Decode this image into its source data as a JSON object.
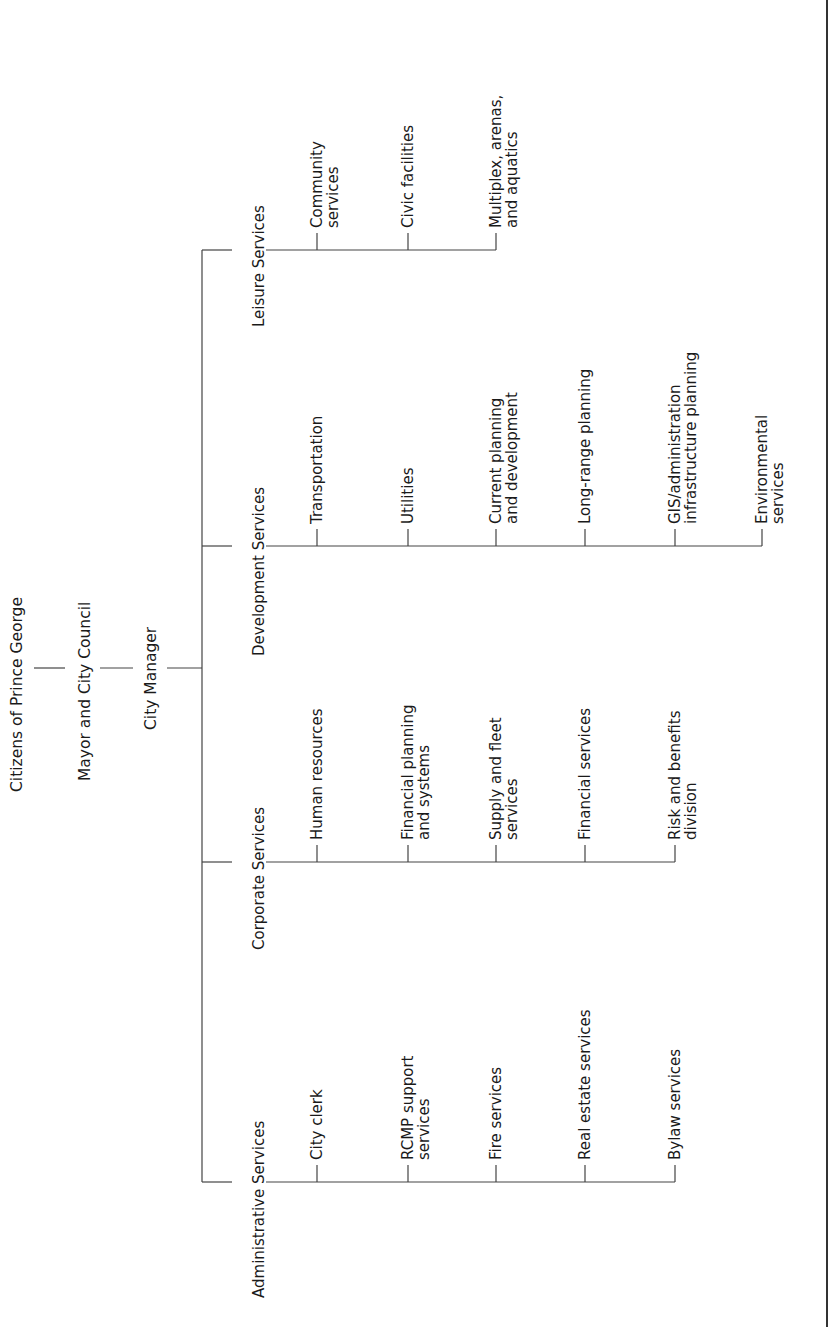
{
  "diagram": {
    "type": "org_chart",
    "orientation": "rotated-90-ccw",
    "colors": {
      "line": "#444444",
      "text": "#1a1a1a",
      "background": "#ffffff",
      "border": "#333333"
    },
    "root": "Citizens of Prince George",
    "level2": "Mayor and City Council",
    "level3": "City Manager",
    "departments": [
      {
        "name": "Leisure Services",
        "units": [
          [
            "Community",
            "services"
          ],
          [
            "Civic facilities"
          ],
          [
            "Multiplex, arenas,",
            "and aquatics"
          ]
        ]
      },
      {
        "name": "Development Services",
        "units": [
          [
            "Transportation"
          ],
          [
            "Utilities"
          ],
          [
            "Current planning",
            "and development"
          ],
          [
            "Long-range planning"
          ],
          [
            "GIS/administration",
            "infrastructure planning"
          ],
          [
            "Environmental",
            "services"
          ]
        ]
      },
      {
        "name": "Corporate Services",
        "units": [
          [
            "Human resources"
          ],
          [
            "Financial planning",
            "and systems"
          ],
          [
            "Supply and fleet",
            "services"
          ],
          [
            "Financial services"
          ],
          [
            "Risk and benefits",
            "division"
          ]
        ]
      },
      {
        "name": "Administrative Services",
        "units": [
          [
            "City clerk"
          ],
          [
            "RCMP support",
            "services"
          ],
          [
            "Fire services"
          ],
          [
            "Real estate services"
          ],
          [
            "Bylaw services"
          ]
        ]
      }
    ]
  }
}
